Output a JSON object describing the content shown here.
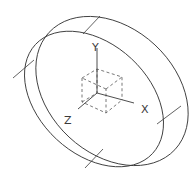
{
  "diagram": {
    "type": "isometric-ring",
    "stroke_color": "#3a3a3a",
    "dash_color": "#555555",
    "axes": {
      "x_label": "X",
      "y_label": "Y",
      "z_label": "Z"
    }
  }
}
